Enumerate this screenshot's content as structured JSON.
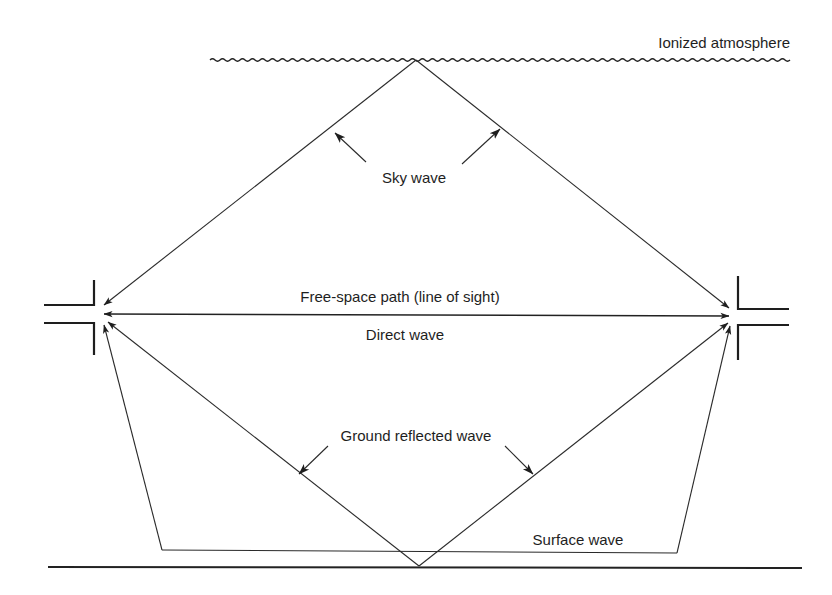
{
  "diagram": {
    "labels": {
      "ionized_atmosphere": "Ionized atmosphere",
      "sky_wave": "Sky wave",
      "free_space_path": "Free-space path (line of sight)",
      "direct_wave": "Direct wave",
      "ground_reflected_wave": "Ground reflected wave",
      "surface_wave": "Surface wave"
    },
    "nodes": [
      {
        "id": "transmitter-antenna",
        "position": "left"
      },
      {
        "id": "receiver-antenna",
        "position": "right"
      },
      {
        "id": "ionosphere-reflection-point",
        "position": "top-center"
      },
      {
        "id": "ground-reflection-point",
        "position": "bottom-center"
      }
    ],
    "paths": [
      {
        "name": "sky-wave",
        "via": "ionized atmosphere"
      },
      {
        "name": "direct-wave",
        "via": "line of sight"
      },
      {
        "name": "ground-reflected-wave",
        "via": "ground"
      },
      {
        "name": "surface-wave",
        "via": "earth surface"
      }
    ],
    "colors": {
      "ink": "#1e1e1e",
      "background": "#ffffff"
    }
  }
}
